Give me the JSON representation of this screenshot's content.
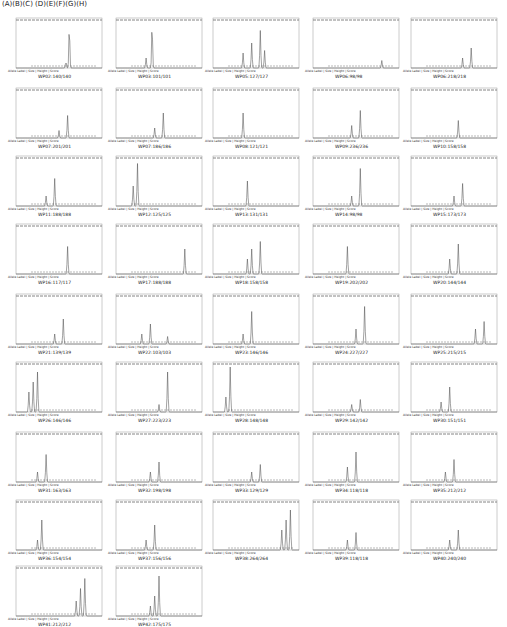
{
  "header": {
    "text": "(A)(B)(C) (D)(E)(F)(G)(H)"
  },
  "meta": "Allele Label | Size | Height | Score",
  "chart_data": {
    "type": "line",
    "panels": [
      {
        "label": "WP02:140/140",
        "peaks": [
          [
            0.62,
            0.8
          ],
          [
            0.58,
            0.12
          ]
        ]
      },
      {
        "label": "WP03:101/101",
        "peaks": [
          [
            0.42,
            0.85
          ],
          [
            0.35,
            0.2
          ]
        ]
      },
      {
        "label": "WP05:127/127",
        "peaks": [
          [
            0.55,
            0.75
          ],
          [
            0.45,
            0.5
          ],
          [
            0.6,
            0.35
          ],
          [
            0.35,
            0.3
          ]
        ]
      },
      {
        "label": "WP06:98/98",
        "peaks": [
          [
            0.8,
            0.15
          ]
        ]
      },
      {
        "label": "WP06:218/218",
        "peaks": [
          [
            0.7,
            0.4
          ],
          [
            0.6,
            0.2
          ]
        ]
      },
      {
        "label": "WP07:201/201",
        "peaks": [
          [
            0.6,
            0.45
          ],
          [
            0.5,
            0.15
          ]
        ]
      },
      {
        "label": "WP07:186/186",
        "peaks": [
          [
            0.55,
            0.5
          ],
          [
            0.45,
            0.2
          ]
        ]
      },
      {
        "label": "WP08:121/121",
        "peaks": [
          [
            0.35,
            0.5
          ]
        ]
      },
      {
        "label": "WP09:236/236",
        "peaks": [
          [
            0.55,
            0.55
          ],
          [
            0.45,
            0.25
          ]
        ]
      },
      {
        "label": "WP10:158/158",
        "peaks": [
          [
            0.55,
            0.35
          ]
        ]
      },
      {
        "label": "WP11:188/188",
        "peaks": [
          [
            0.45,
            0.55
          ],
          [
            0.35,
            0.2
          ]
        ]
      },
      {
        "label": "WP12:125/125",
        "peaks": [
          [
            0.25,
            0.85
          ],
          [
            0.2,
            0.4
          ]
        ]
      },
      {
        "label": "WP13:131/131",
        "peaks": [
          [
            0.4,
            0.5
          ]
        ]
      },
      {
        "label": "WP14:98/98",
        "peaks": [
          [
            0.55,
            0.75
          ],
          [
            0.45,
            0.2
          ]
        ]
      },
      {
        "label": "WP15:173/173",
        "peaks": [
          [
            0.6,
            0.45
          ],
          [
            0.5,
            0.2
          ]
        ]
      },
      {
        "label": "WP16:117/117",
        "peaks": [
          [
            0.6,
            0.55
          ]
        ]
      },
      {
        "label": "WP17:188/188",
        "peaks": [
          [
            0.8,
            0.5
          ]
        ]
      },
      {
        "label": "WP18:158/158",
        "peaks": [
          [
            0.55,
            0.65
          ],
          [
            0.45,
            0.5
          ],
          [
            0.4,
            0.3
          ]
        ]
      },
      {
        "label": "WP19:202/202",
        "peaks": [
          [
            0.4,
            0.55
          ]
        ]
      },
      {
        "label": "WP20:144/144",
        "peaks": [
          [
            0.55,
            0.6
          ],
          [
            0.45,
            0.3
          ]
        ]
      },
      {
        "label": "WP21:139/139",
        "peaks": [
          [
            0.55,
            0.5
          ],
          [
            0.45,
            0.2
          ]
        ]
      },
      {
        "label": "WP22:103/103",
        "peaks": [
          [
            0.4,
            0.4
          ],
          [
            0.3,
            0.2
          ],
          [
            0.6,
            0.15
          ]
        ]
      },
      {
        "label": "WP23:146/146",
        "peaks": [
          [
            0.45,
            0.65
          ],
          [
            0.35,
            0.2
          ]
        ]
      },
      {
        "label": "WP24:227/227",
        "peaks": [
          [
            0.6,
            0.75
          ],
          [
            0.5,
            0.3
          ]
        ]
      },
      {
        "label": "WP25:215/215",
        "peaks": [
          [
            0.85,
            0.45
          ],
          [
            0.75,
            0.3
          ]
        ]
      },
      {
        "label": "WP26:146/146",
        "peaks": [
          [
            0.25,
            0.8
          ],
          [
            0.2,
            0.6
          ],
          [
            0.15,
            0.4
          ]
        ]
      },
      {
        "label": "WP27:223/223",
        "peaks": [
          [
            0.6,
            0.8
          ],
          [
            0.5,
            0.15
          ]
        ]
      },
      {
        "label": "WP28:148/148",
        "peaks": [
          [
            0.2,
            0.9
          ],
          [
            0.15,
            0.3
          ]
        ]
      },
      {
        "label": "WP29:142/142",
        "peaks": [
          [
            0.55,
            0.25
          ],
          [
            0.45,
            0.15
          ]
        ]
      },
      {
        "label": "WP30:151/151",
        "peaks": [
          [
            0.45,
            0.5
          ],
          [
            0.35,
            0.2
          ]
        ]
      },
      {
        "label": "WP31:163/163",
        "peaks": [
          [
            0.35,
            0.55
          ],
          [
            0.25,
            0.2
          ]
        ]
      },
      {
        "label": "WP32:198/198",
        "peaks": [
          [
            0.5,
            0.4
          ],
          [
            0.4,
            0.2
          ]
        ]
      },
      {
        "label": "WP33:129/129",
        "peaks": [
          [
            0.55,
            0.35
          ],
          [
            0.45,
            0.2
          ]
        ]
      },
      {
        "label": "WP34:118/118",
        "peaks": [
          [
            0.5,
            0.6
          ],
          [
            0.4,
            0.3
          ]
        ]
      },
      {
        "label": "WP35:212/212",
        "peaks": [
          [
            0.5,
            0.45
          ],
          [
            0.4,
            0.2
          ]
        ]
      },
      {
        "label": "WP36:154/154",
        "peaks": [
          [
            0.3,
            0.6
          ],
          [
            0.25,
            0.2
          ]
        ]
      },
      {
        "label": "WP37:156/156",
        "peaks": [
          [
            0.45,
            0.5
          ],
          [
            0.35,
            0.2
          ]
        ]
      },
      {
        "label": "WP38:264/264",
        "peaks": [
          [
            0.9,
            0.8
          ],
          [
            0.85,
            0.6
          ],
          [
            0.8,
            0.4
          ]
        ]
      },
      {
        "label": "WP39:118/118",
        "peaks": [
          [
            0.5,
            0.35
          ],
          [
            0.4,
            0.2
          ]
        ]
      },
      {
        "label": "WP40:240/240",
        "peaks": [
          [
            0.55,
            0.4
          ],
          [
            0.45,
            0.2
          ]
        ]
      },
      {
        "label": "WP41:212/212",
        "peaks": [
          [
            0.8,
            0.75
          ],
          [
            0.75,
            0.55
          ],
          [
            0.7,
            0.3
          ]
        ]
      },
      {
        "label": "WP42:175/175",
        "peaks": [
          [
            0.5,
            0.8
          ],
          [
            0.45,
            0.4
          ],
          [
            0.4,
            0.2
          ]
        ]
      }
    ]
  }
}
